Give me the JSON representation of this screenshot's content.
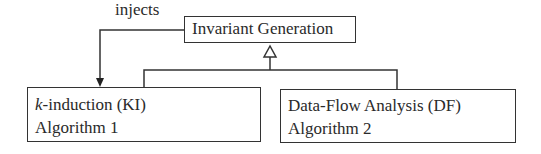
{
  "diagram": {
    "type": "uml-class-hierarchy",
    "nodes": {
      "parent": {
        "label": "Invariant Generation"
      },
      "ki": {
        "title_italic": "k",
        "title_rest": "-induction (KI)",
        "subtitle": "Algorithm 1"
      },
      "df": {
        "title": "Data-Flow Analysis (DF)",
        "subtitle": "Algorithm 2"
      }
    },
    "edges": [
      {
        "from": "Invariant Generation",
        "to": "k-induction (KI)",
        "kind": "association-arrow",
        "label": "injects"
      },
      {
        "from": "k-induction (KI)",
        "to": "Invariant Generation",
        "kind": "generalization"
      },
      {
        "from": "Data-Flow Analysis (DF)",
        "to": "Invariant Generation",
        "kind": "generalization"
      }
    ],
    "edge_label": "injects"
  }
}
